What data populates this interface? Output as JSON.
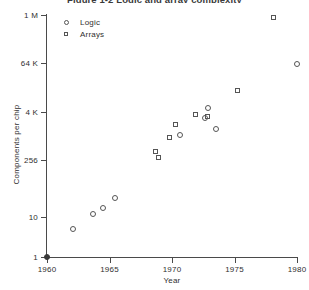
{
  "chart_data": {
    "type": "scatter",
    "title": "Figure 1-2  Logic and array complexity",
    "title_truncated": true,
    "xlabel": "Year",
    "ylabel": "Components per chip",
    "xlim": [
      1960,
      1981
    ],
    "ylim": [
      1,
      1048576
    ],
    "yscale": "log",
    "grid": false,
    "legend_position": "top-left",
    "xticks": [
      1960,
      1965,
      1970,
      1975,
      1980
    ],
    "xtick_labels": [
      "1960",
      "1965",
      "1970",
      "1975",
      "1980"
    ],
    "yticks": [
      1,
      10,
      256,
      4096,
      65536,
      1048576
    ],
    "ytick_labels": [
      "1",
      "10",
      "256",
      "4 K",
      "64 K",
      "1 M"
    ],
    "series": [
      {
        "name": "Logic",
        "marker": "circle",
        "points": [
          {
            "x": 1960.0,
            "y": 1,
            "filled": true
          },
          {
            "x": 1962.1,
            "y": 5
          },
          {
            "x": 1963.7,
            "y": 12
          },
          {
            "x": 1964.5,
            "y": 17
          },
          {
            "x": 1965.4,
            "y": 30
          },
          {
            "x": 1970.6,
            "y": 1100
          },
          {
            "x": 1972.6,
            "y": 2800
          },
          {
            "x": 1972.9,
            "y": 5200
          },
          {
            "x": 1973.5,
            "y": 1500
          },
          {
            "x": 1980.0,
            "y": 65000
          }
        ]
      },
      {
        "name": "Arrays",
        "marker": "square",
        "points": [
          {
            "x": 1968.7,
            "y": 430
          },
          {
            "x": 1968.9,
            "y": 300
          },
          {
            "x": 1969.8,
            "y": 950
          },
          {
            "x": 1970.3,
            "y": 2000
          },
          {
            "x": 1971.9,
            "y": 3600
          },
          {
            "x": 1972.8,
            "y": 3100
          },
          {
            "x": 1975.2,
            "y": 14000
          },
          {
            "x": 1978.1,
            "y": 900000
          }
        ]
      }
    ]
  }
}
